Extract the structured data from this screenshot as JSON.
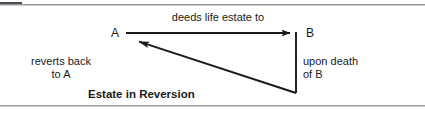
{
  "figure": {
    "title": "Estate in Reversion",
    "width": 425,
    "height": 114,
    "background_color": "#ffffff",
    "ink_color": "#1a1a1a",
    "rule_color": "#9a9a9e"
  },
  "nodes": {
    "a": "A",
    "b": "B"
  },
  "labels": {
    "deeds_life_estate_to": "deeds life estate to",
    "reverts_back_to_a": "reverts back\nto A",
    "upon_death_of_b": "upon death\nof B",
    "estate_in_reversion": "Estate in Reversion"
  },
  "arrows": [
    {
      "name": "a-to-b-arrow",
      "from": "A",
      "to": "B",
      "label": "deeds life estate to",
      "x1": 126,
      "y1": 33,
      "x2": 296,
      "y2": 33,
      "arrowhead": "end"
    },
    {
      "name": "b-down-connector",
      "from": "B",
      "to": "reversion-corner",
      "label": "upon death of B",
      "x1": 296,
      "y1": 33,
      "x2": 296,
      "y2": 93,
      "arrowhead": "none"
    },
    {
      "name": "reverts-to-a-arrow",
      "from": "reversion-corner",
      "to": "A",
      "label": "reverts back to A",
      "x1": 296,
      "y1": 93,
      "x2": 129,
      "y2": 38,
      "arrowhead": "end"
    }
  ]
}
